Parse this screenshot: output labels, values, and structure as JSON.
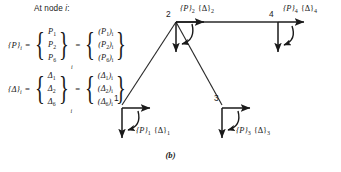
{
  "figure": {
    "caption": "(b)",
    "heading": "At node ",
    "heading_italic": "i",
    "heading_colon": ":"
  },
  "equations": {
    "force": {
      "lhs_symbol": "{P}",
      "lhs_subscript": "i",
      "equals": "=",
      "left_vector": {
        "cells": [
          {
            "sym": "P",
            "sub": "1"
          },
          {
            "sym": "P",
            "sub": "2"
          },
          {
            "sym": "P",
            "sub": "6"
          }
        ],
        "subscript": "i"
      },
      "right_vector": {
        "cells": [
          {
            "text": "(P",
            "sub": "1",
            "tail": ")",
            "outer_sub": "i"
          },
          {
            "text": "(P",
            "sub": "2",
            "tail": ")",
            "outer_sub": "i"
          },
          {
            "text": "(P",
            "sub": "6",
            "tail": ")",
            "outer_sub": "i"
          }
        ]
      }
    },
    "displacement": {
      "lhs_symbol": "{Δ}",
      "lhs_subscript": "i",
      "equals": "=",
      "left_vector": {
        "cells": [
          {
            "sym": "Δ",
            "sub": "1"
          },
          {
            "sym": "Δ",
            "sub": "2"
          },
          {
            "sym": "Δ",
            "sub": "6"
          }
        ],
        "subscript": "i"
      },
      "right_vector": {
        "cells": [
          {
            "text": "(Δ",
            "sub": "1",
            "tail": ")",
            "outer_sub": "i"
          },
          {
            "text": "(Δ",
            "sub": "2",
            "tail": ")",
            "outer_sub": "i"
          },
          {
            "text": "(Δ",
            "sub": "6",
            "tail": ")",
            "outer_sub": "i"
          }
        ]
      }
    }
  },
  "nodes": [
    {
      "id": "1",
      "number": "1",
      "force_symbol": "{P}",
      "force_sub": "1",
      "displacement_symbol": "{Δ}",
      "displacement_sub": "1"
    },
    {
      "id": "2",
      "number": "2",
      "force_symbol": "{P}",
      "force_sub": "2",
      "displacement_symbol": "{Δ}",
      "displacement_sub": "2"
    },
    {
      "id": "3",
      "number": "3",
      "force_symbol": "{P}",
      "force_sub": "3",
      "displacement_symbol": "{Δ}",
      "displacement_sub": "3"
    },
    {
      "id": "4",
      "number": "4",
      "force_symbol": "{P}",
      "force_sub": "4",
      "displacement_symbol": "{Δ}",
      "displacement_sub": "4"
    }
  ],
  "colors": {
    "ink": "#1a1a1a",
    "member": "#2a2a2a",
    "background": "#ffffff"
  }
}
